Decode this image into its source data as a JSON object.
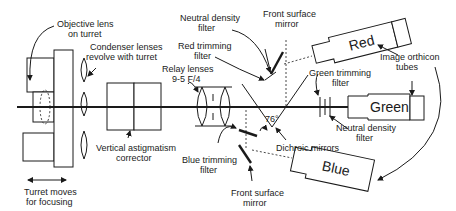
{
  "diagram": {
    "type": "optical-schematic",
    "labels": {
      "objective_lens": [
        "Objective lens",
        "on turret"
      ],
      "condenser_lenses": [
        "Condenser lenses",
        "revolve with turret"
      ],
      "turret_moves": [
        "Turret moves",
        "for focusing"
      ],
      "vertical_astigmatism": [
        "Vertical astigmatism",
        "corrector"
      ],
      "relay_lenses": [
        "Relay lenses",
        "9-5 F/4"
      ],
      "neutral_density_top": [
        "Neutral density",
        "filter"
      ],
      "red_trimming": [
        "Red trimming",
        "filter"
      ],
      "front_surface_mirror_top": [
        "Front surface",
        "mirror"
      ],
      "green_trimming": [
        "Green trimming",
        "filter"
      ],
      "image_orthicon": [
        "Image orthicon",
        "tubes"
      ],
      "angle": "76°",
      "dichroic_mirrors": "Dichroic mirrors",
      "neutral_density_right": [
        "Neutral density",
        "filter"
      ],
      "blue_trimming": [
        "Blue trimming",
        "filter"
      ],
      "front_surface_mirror_bottom": [
        "Front surface",
        "mirror"
      ]
    },
    "tubes": {
      "red": "Red",
      "green": "Green",
      "blue": "Blue"
    }
  }
}
